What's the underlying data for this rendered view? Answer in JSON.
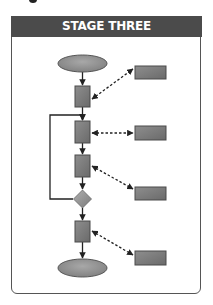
{
  "header": {
    "title": "STAGE THREE"
  },
  "colors": {
    "header_bg": "#4b4b4b",
    "header_text": "#ffffff",
    "shape_fill": "#7c7c7c",
    "shape_stroke": "#4a4a4a",
    "diamond_fill": "#9a9a9a",
    "line": "#222222"
  },
  "diagram": {
    "nodes": [
      {
        "id": "start",
        "type": "ellipse",
        "label": ""
      },
      {
        "id": "step1",
        "type": "process",
        "label": ""
      },
      {
        "id": "step2",
        "type": "process",
        "label": ""
      },
      {
        "id": "step3",
        "type": "process",
        "label": ""
      },
      {
        "id": "decision",
        "type": "diamond",
        "label": ""
      },
      {
        "id": "step4",
        "type": "process",
        "label": ""
      },
      {
        "id": "end",
        "type": "ellipse",
        "label": ""
      },
      {
        "id": "ext1",
        "type": "box",
        "label": ""
      },
      {
        "id": "ext2",
        "type": "box",
        "label": ""
      },
      {
        "id": "ext3",
        "type": "box",
        "label": ""
      },
      {
        "id": "ext4",
        "type": "box",
        "label": ""
      }
    ],
    "edges": [
      {
        "from": "start",
        "to": "step1",
        "style": "solid"
      },
      {
        "from": "step1",
        "to": "step2",
        "style": "solid"
      },
      {
        "from": "step2",
        "to": "step3",
        "style": "solid"
      },
      {
        "from": "step3",
        "to": "decision",
        "style": "solid"
      },
      {
        "from": "decision",
        "to": "step4",
        "style": "solid"
      },
      {
        "from": "step4",
        "to": "end",
        "style": "solid"
      },
      {
        "from": "decision",
        "to": "step2",
        "style": "solid",
        "note": "loop back"
      },
      {
        "from": "step1",
        "to": "ext1",
        "style": "dashed",
        "bidirectional": true
      },
      {
        "from": "step2",
        "to": "ext2",
        "style": "dashed",
        "bidirectional": true
      },
      {
        "from": "step3",
        "to": "ext3",
        "style": "dashed",
        "bidirectional": true
      },
      {
        "from": "step4",
        "to": "ext4",
        "style": "dashed",
        "bidirectional": true
      }
    ]
  }
}
